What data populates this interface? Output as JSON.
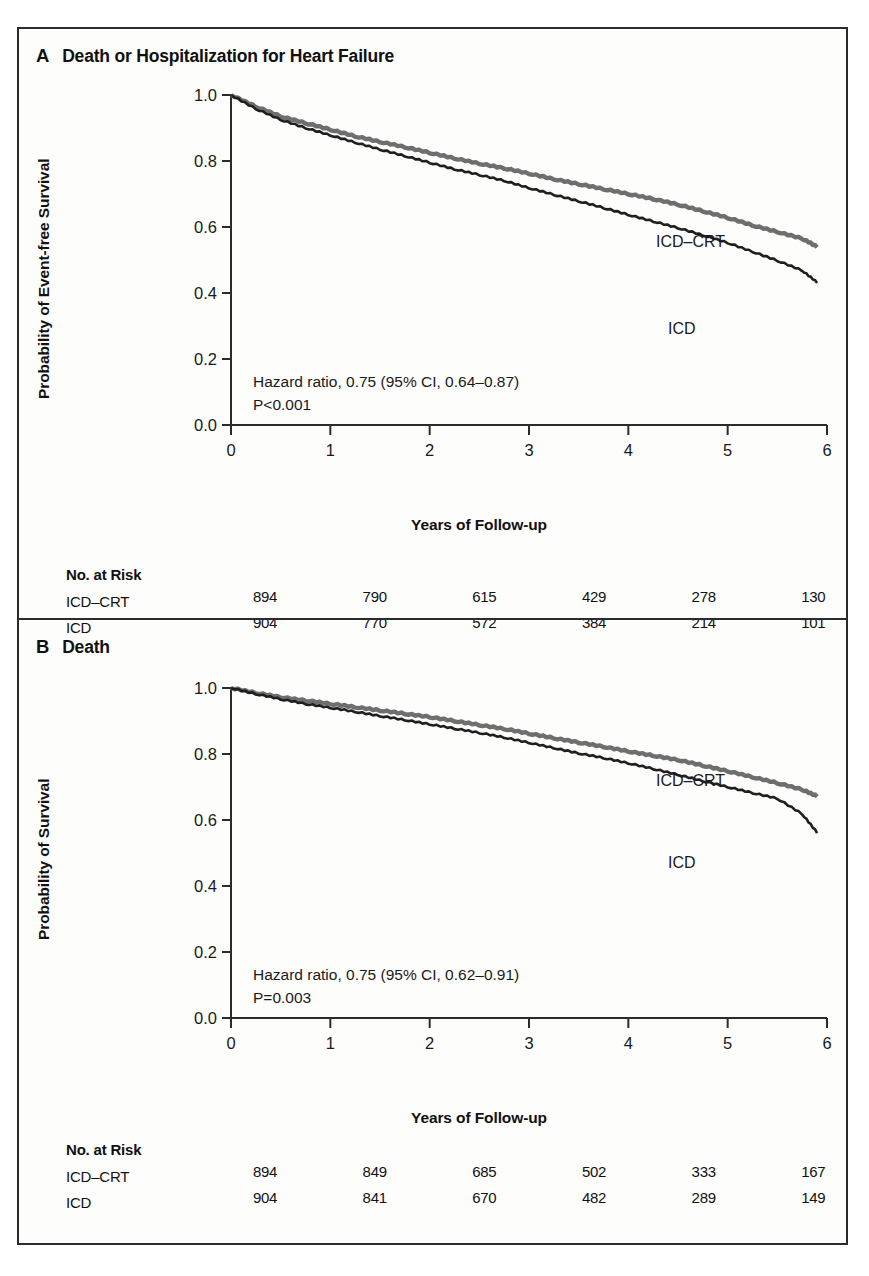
{
  "figure": {
    "panels": [
      {
        "letter": "A",
        "title": "Death or Hospitalization for Heart Failure",
        "ylabel": "Probability of Event-free Survival",
        "xlabel": "Years of Follow-up",
        "stat_line1": "Hazard ratio, 0.75 (95% CI, 0.64–0.87)",
        "stat_line2": "P<0.001",
        "label_crt": "ICD–CRT",
        "label_icd": "ICD",
        "risk_title": "No. at Risk",
        "risk_rows": [
          {
            "name": "ICD–CRT",
            "values": [
              "894",
              "790",
              "615",
              "429",
              "278",
              "130",
              "41"
            ]
          },
          {
            "name": "ICD",
            "values": [
              "904",
              "770",
              "572",
              "384",
              "214",
              "101",
              "19"
            ]
          }
        ]
      },
      {
        "letter": "B",
        "title": "Death",
        "ylabel": "Probability of Survival",
        "xlabel": "Years of Follow-up",
        "stat_line1": "Hazard ratio, 0.75 (95% CI, 0.62–0.91)",
        "stat_line2": "P=0.003",
        "label_crt": "ICD–CRT",
        "label_icd": "ICD",
        "risk_title": "No. at Risk",
        "risk_rows": [
          {
            "name": "ICD–CRT",
            "values": [
              "894",
              "849",
              "685",
              "502",
              "333",
              "167",
              "53"
            ]
          },
          {
            "name": "ICD",
            "values": [
              "904",
              "841",
              "670",
              "482",
              "289",
              "149",
              "35"
            ]
          }
        ]
      }
    ],
    "colors": {
      "crt_line": "#6e6e6e",
      "icd_line": "#1f1f1f",
      "axis": "#2b2b2b",
      "frame": "#2b2b2b",
      "background": "#fdfdfc"
    }
  },
  "chart_data": [
    {
      "type": "line",
      "title": "A  Death or Hospitalization for Heart Failure",
      "xlabel": "Years of Follow-up",
      "ylabel": "Probability of Event-free Survival",
      "xlim": [
        0,
        6
      ],
      "ylim": [
        0,
        1
      ],
      "xticks": [
        "0",
        "1",
        "2",
        "3",
        "4",
        "5",
        "6"
      ],
      "yticks": [
        "0.0",
        "0.2",
        "0.4",
        "0.6",
        "0.8",
        "1.0"
      ],
      "grid": false,
      "legend": "inline-curve-labels",
      "annotations": [
        "Hazard ratio, 0.75 (95% CI, 0.64–0.87)",
        "P<0.001"
      ],
      "x": [
        0,
        0.25,
        0.5,
        0.75,
        1,
        1.25,
        1.5,
        1.75,
        2,
        2.25,
        2.5,
        2.75,
        3,
        3.25,
        3.5,
        3.75,
        4,
        4.25,
        4.5,
        4.75,
        5,
        5.25,
        5.5,
        5.75,
        5.9
      ],
      "series": [
        {
          "name": "ICD–CRT",
          "color": "#6e6e6e",
          "values": [
            1.0,
            0.965,
            0.935,
            0.915,
            0.895,
            0.875,
            0.858,
            0.842,
            0.825,
            0.808,
            0.792,
            0.778,
            0.762,
            0.745,
            0.73,
            0.715,
            0.7,
            0.685,
            0.668,
            0.648,
            0.628,
            0.605,
            0.585,
            0.565,
            0.54
          ]
        },
        {
          "name": "ICD",
          "color": "#1f1f1f",
          "values": [
            1.0,
            0.958,
            0.925,
            0.9,
            0.878,
            0.856,
            0.835,
            0.815,
            0.795,
            0.775,
            0.758,
            0.74,
            0.718,
            0.698,
            0.678,
            0.658,
            0.637,
            0.617,
            0.597,
            0.575,
            0.552,
            0.525,
            0.498,
            0.468,
            0.432
          ]
        }
      ],
      "risk_table": {
        "title": "No. at Risk",
        "times": [
          0,
          1,
          2,
          3,
          4,
          5,
          6
        ],
        "rows": [
          {
            "name": "ICD–CRT",
            "values": [
              894,
              790,
              615,
              429,
              278,
              130,
              41
            ]
          },
          {
            "name": "ICD",
            "values": [
              904,
              770,
              572,
              384,
              214,
              101,
              19
            ]
          }
        ]
      }
    },
    {
      "type": "line",
      "title": "B  Death",
      "xlabel": "Years of Follow-up",
      "ylabel": "Probability of Survival",
      "xlim": [
        0,
        6
      ],
      "ylim": [
        0,
        1
      ],
      "xticks": [
        "0",
        "1",
        "2",
        "3",
        "4",
        "5",
        "6"
      ],
      "yticks": [
        "0.0",
        "0.2",
        "0.4",
        "0.6",
        "0.8",
        "1.0"
      ],
      "grid": false,
      "legend": "inline-curve-labels",
      "annotations": [
        "Hazard ratio, 0.75 (95% CI, 0.62–0.91)",
        "P=0.003"
      ],
      "x": [
        0,
        0.25,
        0.5,
        0.75,
        1,
        1.25,
        1.5,
        1.75,
        2,
        2.25,
        2.5,
        2.75,
        3,
        3.25,
        3.5,
        3.75,
        4,
        4.25,
        4.5,
        4.75,
        5,
        5.25,
        5.5,
        5.75,
        5.9
      ],
      "series": [
        {
          "name": "ICD–CRT",
          "color": "#6e6e6e",
          "values": [
            1.0,
            0.985,
            0.972,
            0.962,
            0.952,
            0.942,
            0.932,
            0.922,
            0.912,
            0.9,
            0.888,
            0.876,
            0.862,
            0.848,
            0.835,
            0.822,
            0.808,
            0.795,
            0.782,
            0.765,
            0.748,
            0.73,
            0.712,
            0.692,
            0.672
          ]
        },
        {
          "name": "ICD",
          "color": "#1f1f1f",
          "values": [
            1.0,
            0.982,
            0.966,
            0.952,
            0.94,
            0.928,
            0.915,
            0.903,
            0.89,
            0.877,
            0.864,
            0.85,
            0.834,
            0.818,
            0.802,
            0.788,
            0.772,
            0.755,
            0.737,
            0.718,
            0.7,
            0.682,
            0.665,
            0.618,
            0.562
          ]
        }
      ],
      "risk_table": {
        "title": "No. at Risk",
        "times": [
          0,
          1,
          2,
          3,
          4,
          5,
          6
        ],
        "rows": [
          {
            "name": "ICD–CRT",
            "values": [
              894,
              849,
              685,
              502,
              333,
              167,
              53
            ]
          },
          {
            "name": "ICD",
            "values": [
              904,
              841,
              670,
              482,
              289,
              149,
              35
            ]
          }
        ]
      }
    }
  ]
}
